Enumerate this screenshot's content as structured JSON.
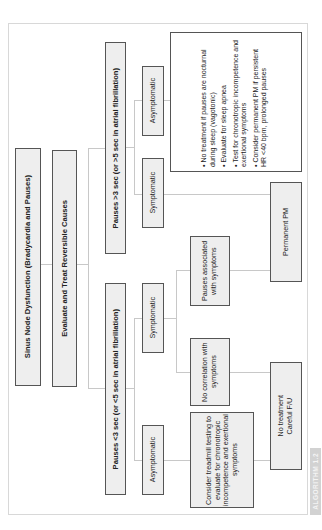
{
  "diagram": {
    "root": "Sinus Node Dysfunction (Bradycardia and Pauses)",
    "step2": "Evaluate and Treat Reversible Causes",
    "branches": [
      {
        "label": "Pauses >3 sec (or >5 sec in atrial fibrillation)",
        "children": [
          {
            "label": "Asymptomatic"
          },
          {
            "label": "Symptomatic"
          }
        ]
      },
      {
        "label": "Pauses <3 sec (or <5 sec in atrial fibrillation)",
        "children": [
          {
            "label": "Symptomatic"
          },
          {
            "label": "Asymptomatic"
          }
        ]
      }
    ],
    "asymptomatic_long_bullets": [
      "No treatment if pauses are nocturnal during sleep (vagotonic)",
      "Evaluate for sleep apnea",
      "Test for chronotropic incompetence and exertional symptoms",
      "Consider permanent PM if persistent HR <40 bpm, prolonged pauses"
    ],
    "pauses_associated": "Pauses associated with symptoms",
    "no_correlation": "No correlation with symptoms",
    "treadmill": "Consider treadmill testing to evaluate for chronotropic incompetence and exertional symptoms",
    "permanent_pm": "Permanent PM",
    "no_treatment": "No treatment\nCareful F/U",
    "bullet_char": "•"
  },
  "label": "ALGORITHM 1.2",
  "colors": {
    "box_fill": "#eeeeee",
    "box_border": "#555555",
    "connector": "#c8c8c8",
    "label_bg": "#d2d2d2"
  }
}
